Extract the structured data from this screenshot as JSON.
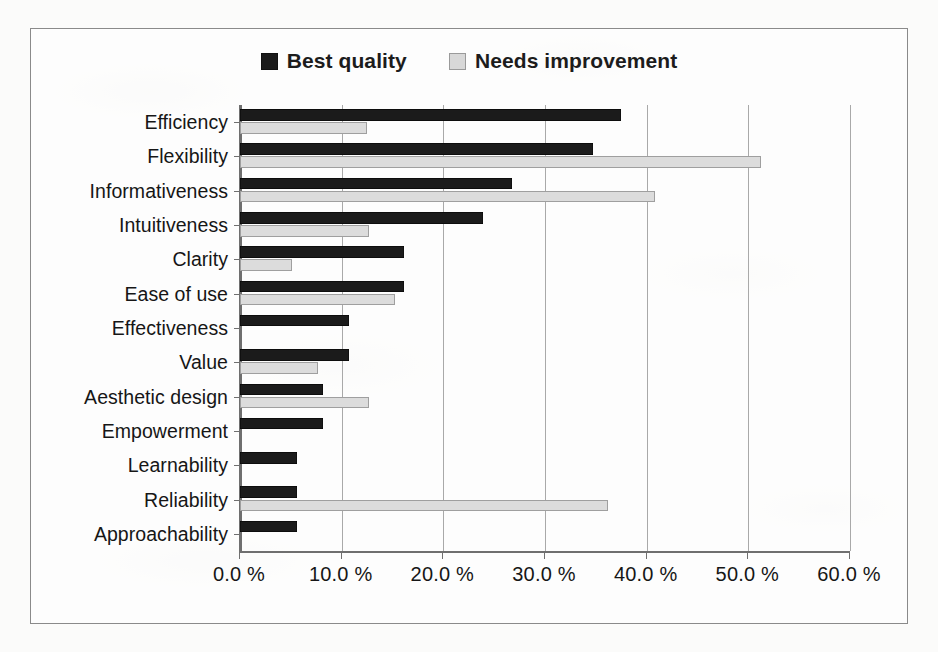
{
  "chart_data": {
    "type": "bar",
    "orientation": "horizontal",
    "title": "",
    "subtitle": "",
    "xlabel": "",
    "ylabel": "",
    "xlim": [
      0,
      60
    ],
    "xtick_labels": [
      "0.0 %",
      "10.0 %",
      "20.0 %",
      "30.0 %",
      "40.0 %",
      "50.0 %",
      "60.0 %"
    ],
    "xtick_values": [
      0,
      10,
      20,
      30,
      40,
      50,
      60
    ],
    "grid": "vertical",
    "legend_position": "top-center",
    "value_suffix": " %",
    "categories": [
      "Efficiency",
      "Flexibility",
      "Informativeness",
      "Intuitiveness",
      "Clarity",
      "Ease of use",
      "Effectiveness",
      "Value",
      "Aesthetic design",
      "Empowerment",
      "Learnability",
      "Reliability",
      "Approachability"
    ],
    "series": [
      {
        "name": "Best quality",
        "color": "#1b1b1b",
        "values": [
          37.5,
          34.7,
          26.8,
          23.9,
          16.1,
          16.1,
          10.7,
          10.7,
          8.2,
          8.2,
          5.6,
          5.6,
          5.6
        ]
      },
      {
        "name": "Needs improvement",
        "color": "#dcdcdc",
        "values": [
          12.5,
          51.2,
          40.8,
          12.7,
          5.1,
          15.2,
          0,
          7.7,
          12.7,
          0,
          0,
          36.2,
          0
        ]
      }
    ]
  },
  "legend": {
    "entries": [
      {
        "label": "Best quality",
        "swatch": "dark-square-swatch"
      },
      {
        "label": "Needs improvement",
        "swatch": "light-square-swatch"
      }
    ]
  },
  "colors": {
    "best_quality": "#1b1b1b",
    "needs_improvement": "#dcdcdc",
    "gridline": "#a9a9a9",
    "axis": "#6f6f6f",
    "frame": "#8a8a8a",
    "text": "#161616"
  }
}
